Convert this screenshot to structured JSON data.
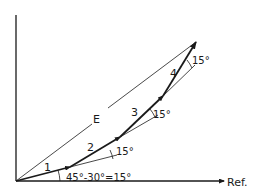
{
  "diagram": {
    "type": "phasor-vector-diagram",
    "axes": {
      "reference_label": "Ref."
    },
    "resultant": {
      "label": "E"
    },
    "vectors": [
      {
        "label": "1"
      },
      {
        "label": "2"
      },
      {
        "label": "3"
      },
      {
        "label": "4"
      }
    ],
    "angles": {
      "first": "45°-30°=15°",
      "second": "15°",
      "third": "15°",
      "fourth": "15°"
    },
    "colors": {
      "line": "#1a1a1a",
      "background": "#ffffff"
    }
  }
}
